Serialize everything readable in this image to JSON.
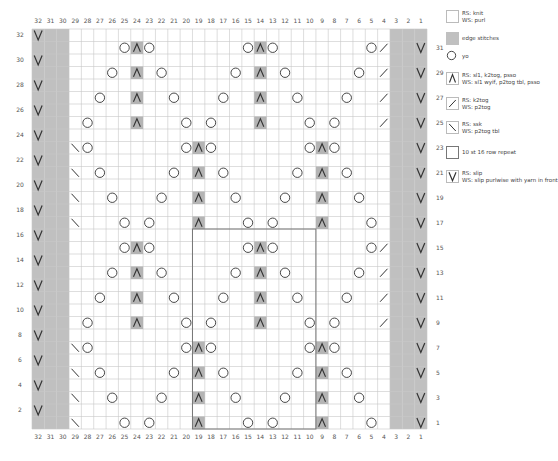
{
  "chart": {
    "columns": 32,
    "rows": 32,
    "edge_columns_left": [
      32,
      31,
      30
    ],
    "edge_columns_right": [
      3,
      2,
      1
    ],
    "repeat_box": {
      "col_from": 19,
      "col_to": 10,
      "row_from": 1,
      "row_to": 16
    },
    "colors": {
      "grid": "#c8c8c8",
      "edge": "#c0c0c0",
      "dec_bg": "#b4b4b4",
      "symbol": "#333333",
      "repeat_border": "#777777"
    },
    "stitches": {
      "31": [
        [
          25,
          "yo"
        ],
        [
          24,
          "cdd"
        ],
        [
          23,
          "yo"
        ],
        [
          15,
          "yo"
        ],
        [
          14,
          "cdd"
        ],
        [
          13,
          "yo"
        ],
        [
          5,
          "yo"
        ],
        [
          4,
          "k2tog"
        ]
      ],
      "29": [
        [
          26,
          "yo"
        ],
        [
          24,
          "cdd"
        ],
        [
          22,
          "yo"
        ],
        [
          16,
          "yo"
        ],
        [
          14,
          "cdd"
        ],
        [
          12,
          "yo"
        ],
        [
          6,
          "yo"
        ],
        [
          4,
          "k2tog"
        ]
      ],
      "27": [
        [
          27,
          "yo"
        ],
        [
          24,
          "cdd"
        ],
        [
          21,
          "yo"
        ],
        [
          17,
          "yo"
        ],
        [
          14,
          "cdd"
        ],
        [
          11,
          "yo"
        ],
        [
          7,
          "yo"
        ],
        [
          4,
          "k2tog"
        ]
      ],
      "25": [
        [
          28,
          "yo"
        ],
        [
          24,
          "cdd"
        ],
        [
          20,
          "yo"
        ],
        [
          18,
          "yo"
        ],
        [
          14,
          "cdd"
        ],
        [
          10,
          "yo"
        ],
        [
          8,
          "yo"
        ],
        [
          4,
          "k2tog"
        ]
      ],
      "23": [
        [
          29,
          "ssk"
        ],
        [
          28,
          "yo"
        ],
        [
          20,
          "yo"
        ],
        [
          19,
          "cdd"
        ],
        [
          18,
          "yo"
        ],
        [
          10,
          "yo"
        ],
        [
          9,
          "cdd"
        ],
        [
          8,
          "yo"
        ]
      ],
      "21": [
        [
          29,
          "ssk"
        ],
        [
          27,
          "yo"
        ],
        [
          21,
          "yo"
        ],
        [
          19,
          "cdd"
        ],
        [
          17,
          "yo"
        ],
        [
          11,
          "yo"
        ],
        [
          9,
          "cdd"
        ],
        [
          7,
          "yo"
        ]
      ],
      "19": [
        [
          29,
          "ssk"
        ],
        [
          26,
          "yo"
        ],
        [
          22,
          "yo"
        ],
        [
          19,
          "cdd"
        ],
        [
          16,
          "yo"
        ],
        [
          12,
          "yo"
        ],
        [
          9,
          "cdd"
        ],
        [
          6,
          "yo"
        ]
      ],
      "17": [
        [
          29,
          "ssk"
        ],
        [
          25,
          "yo"
        ],
        [
          23,
          "yo"
        ],
        [
          19,
          "cdd"
        ],
        [
          15,
          "yo"
        ],
        [
          13,
          "yo"
        ],
        [
          9,
          "cdd"
        ],
        [
          5,
          "yo"
        ]
      ],
      "15": [
        [
          25,
          "yo"
        ],
        [
          24,
          "cdd"
        ],
        [
          23,
          "yo"
        ],
        [
          15,
          "yo"
        ],
        [
          14,
          "cdd"
        ],
        [
          13,
          "yo"
        ],
        [
          5,
          "yo"
        ],
        [
          4,
          "k2tog"
        ]
      ],
      "13": [
        [
          26,
          "yo"
        ],
        [
          24,
          "cdd"
        ],
        [
          22,
          "yo"
        ],
        [
          16,
          "yo"
        ],
        [
          14,
          "cdd"
        ],
        [
          12,
          "yo"
        ],
        [
          6,
          "yo"
        ],
        [
          4,
          "k2tog"
        ]
      ],
      "11": [
        [
          27,
          "yo"
        ],
        [
          24,
          "cdd"
        ],
        [
          21,
          "yo"
        ],
        [
          17,
          "yo"
        ],
        [
          14,
          "cdd"
        ],
        [
          11,
          "yo"
        ],
        [
          7,
          "yo"
        ],
        [
          4,
          "k2tog"
        ]
      ],
      "9": [
        [
          28,
          "yo"
        ],
        [
          24,
          "cdd"
        ],
        [
          20,
          "yo"
        ],
        [
          18,
          "yo"
        ],
        [
          14,
          "cdd"
        ],
        [
          10,
          "yo"
        ],
        [
          8,
          "yo"
        ],
        [
          4,
          "k2tog"
        ]
      ],
      "7": [
        [
          29,
          "ssk"
        ],
        [
          28,
          "yo"
        ],
        [
          20,
          "yo"
        ],
        [
          19,
          "cdd"
        ],
        [
          18,
          "yo"
        ],
        [
          10,
          "yo"
        ],
        [
          9,
          "cdd"
        ],
        [
          8,
          "yo"
        ]
      ],
      "5": [
        [
          29,
          "ssk"
        ],
        [
          27,
          "yo"
        ],
        [
          21,
          "yo"
        ],
        [
          19,
          "cdd"
        ],
        [
          17,
          "yo"
        ],
        [
          11,
          "yo"
        ],
        [
          9,
          "cdd"
        ],
        [
          7,
          "yo"
        ]
      ],
      "3": [
        [
          29,
          "ssk"
        ],
        [
          26,
          "yo"
        ],
        [
          22,
          "yo"
        ],
        [
          19,
          "cdd"
        ],
        [
          16,
          "yo"
        ],
        [
          12,
          "yo"
        ],
        [
          9,
          "cdd"
        ],
        [
          6,
          "yo"
        ]
      ],
      "1": [
        [
          29,
          "ssk"
        ],
        [
          25,
          "yo"
        ],
        [
          23,
          "yo"
        ],
        [
          19,
          "cdd"
        ],
        [
          15,
          "yo"
        ],
        [
          13,
          "yo"
        ],
        [
          9,
          "cdd"
        ],
        [
          5,
          "yo"
        ]
      ]
    },
    "slip_even_rows_col": 32,
    "slip_odd_rows_col": 1,
    "left_row_labels": [
      32,
      30,
      28,
      26,
      24,
      22,
      20,
      18,
      16,
      14,
      12,
      10,
      8,
      6,
      4,
      2
    ],
    "right_row_labels": [
      31,
      29,
      27,
      25,
      23,
      21,
      19,
      17,
      15,
      13,
      11,
      9,
      7,
      5,
      3,
      1
    ]
  },
  "legend": [
    {
      "symbol": "knit",
      "line1": "RS: knit",
      "line2": "WS: purl"
    },
    {
      "symbol": "edge",
      "line1": "edge stitches",
      "line2": ""
    },
    {
      "symbol": "yo",
      "line1": "yo",
      "line2": ""
    },
    {
      "symbol": "cdd",
      "line1": "RS: sl1, k2tog, psso",
      "line2": "WS: sl1 wyif, p2tog tbl, psso"
    },
    {
      "symbol": "k2tog",
      "line1": "RS: k2tog",
      "line2": "WS: p2tog"
    },
    {
      "symbol": "ssk",
      "line1": "RS: ssk",
      "line2": "WS: p2tog tbl"
    },
    {
      "symbol": "repeat",
      "line1": "10 st 16 row repeat",
      "line2": ""
    },
    {
      "symbol": "slip",
      "line1": "RS: slip",
      "line2": "WS: slip purlwise with yarn in front"
    }
  ]
}
